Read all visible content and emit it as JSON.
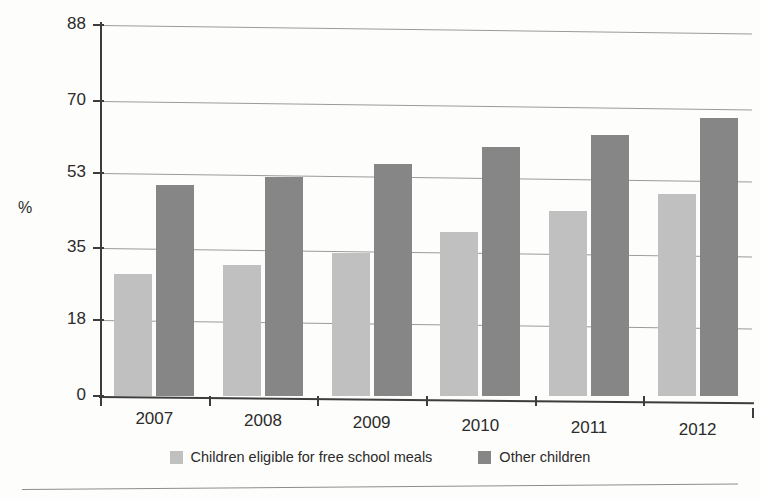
{
  "chart_data": {
    "type": "bar",
    "title": "",
    "xlabel": "",
    "ylabel": "%",
    "categories": [
      "2007",
      "2008",
      "2009",
      "2010",
      "2011",
      "2012"
    ],
    "series": [
      {
        "name": "Children eligible for free school meals",
        "color": "#c0c0c0",
        "values": [
          29,
          31,
          34,
          39,
          44,
          48
        ]
      },
      {
        "name": "Other children",
        "color": "#868686",
        "values": [
          50,
          52,
          55,
          59,
          62,
          66
        ]
      }
    ],
    "ylim": [
      0,
      88
    ],
    "yticks": [
      0,
      18,
      35,
      53,
      70,
      88
    ],
    "ytick_labels": [
      "0",
      "18",
      "35",
      "53",
      "70",
      "88"
    ],
    "grid": true,
    "legend_position": "bottom"
  },
  "legend": {
    "items": [
      {
        "label": "Children eligible for free school meals",
        "color": "#c0c0c0"
      },
      {
        "label": "Other children",
        "color": "#868686"
      }
    ]
  }
}
